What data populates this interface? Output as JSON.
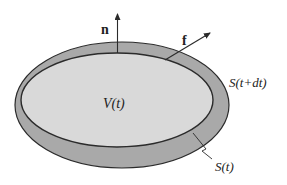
{
  "colors": {
    "background": "#ffffff",
    "outer_band": "#a9a9a9",
    "inner_region": "#d9d9d9",
    "stroke": "#2b2b2b"
  },
  "labels": {
    "normal_vector": "n",
    "force_vector": "f",
    "volume": "V(t)",
    "surface_later": "S(t+dt)",
    "surface_now": "S(t)"
  },
  "elements": {
    "outer_surface": "S(t+dt)",
    "inner_surface": "S(t)",
    "region": "V(t)",
    "arrows": [
      "n",
      "f"
    ]
  }
}
